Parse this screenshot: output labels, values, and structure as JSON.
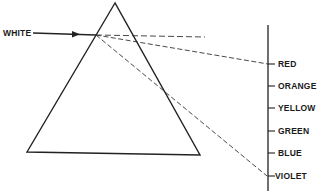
{
  "diagram": {
    "type": "prism-dispersion",
    "incoming_label": "WHITE",
    "spectrum": [
      {
        "label": "RED",
        "y": 64
      },
      {
        "label": "ORANGE",
        "y": 86
      },
      {
        "label": "YELLOW",
        "y": 108
      },
      {
        "label": "GREEN",
        "y": 131
      },
      {
        "label": "BLUE",
        "y": 153
      },
      {
        "label": "VIOLET",
        "y": 176
      }
    ],
    "colors": {
      "line": "#222222",
      "background": "#ffffff"
    }
  }
}
